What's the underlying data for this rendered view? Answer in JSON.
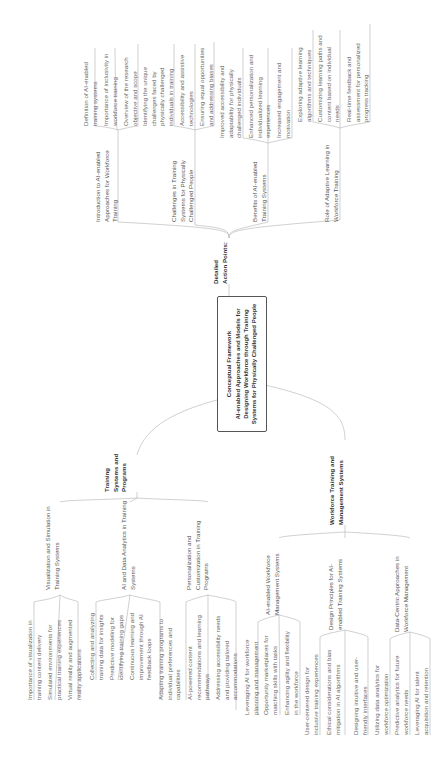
{
  "diagram": {
    "type": "mind-map",
    "orientation": "rotated-90",
    "root": {
      "title": "Conceptual Framework",
      "subtitle": "AI-enabled Approaches and Models for Designing Workforce through Training Systems for Physically Challenged People"
    },
    "branches": [
      {
        "label": "Detailed Action Points:",
        "children": [
          {
            "label": "Introduction to AI-enabled Approaches for Workforce Training",
            "leaves": [
              "Definition of AI-enabled training systems",
              "Importance of inclusivity in workforce training",
              "Overview of the research objective and scope"
            ]
          },
          {
            "label": "Challenges in Training Systems for Physically Challenged People",
            "leaves": [
              "Identifying the unique challenges faced by physically challenged individuals in training",
              "Accessibility and assistive technologies",
              "Ensuring equal opportunities and addressing biases"
            ]
          },
          {
            "label": "Benefits of AI-enabled Training Systems",
            "leaves": [
              "Improved accessibility and adaptability for physically challenged individuals",
              "Enhanced personalization and individualized learning experiences",
              "Increased engagement and motivation"
            ]
          },
          {
            "label": "Role of Adaptive Learning in Workforce Training",
            "leaves": [
              "Exploring adaptive learning algorithms and techniques",
              "Customizing learning paths and content based on individual needs",
              "Real-time feedback and assessment for personalized progress tracking"
            ]
          }
        ]
      },
      {
        "label": "Training Systems and Programs",
        "children": [
          {
            "label": "Visualization and Simulation in Training Systems",
            "leaves": [
              "Importance of visualization in training content delivery",
              "Simulated environments for practical training experiences",
              "Virtual reality and augmented reality applications"
            ]
          },
          {
            "label": "AI and Data Analytics in Training Systems",
            "leaves": [
              "Collecting and analyzing training data for insights",
              "Predictive modeling for identifying training gaps",
              "Continuous learning and improvement through AI feedback loops"
            ]
          },
          {
            "label": "Personalization and Customization in Training Programs",
            "leaves": [
              "Adapting training programs to individual preferences and capabilities",
              "AI-powered content recommendations and learning pathways",
              "Addressing accessibility needs and providing tailored accommodations"
            ]
          }
        ]
      },
      {
        "label": "Workforce Training and Management Systems",
        "children": [
          {
            "label": "AI-enabled Workforce Management Systems",
            "leaves": [
              "Leveraging AI for workforce planning and management",
              "Opportunity marketplaces for matching skills with tasks",
              "Enhancing agility and flexibility in the workforce"
            ]
          },
          {
            "label": "Design Principles for AI-enabled Training Systems",
            "leaves": [
              "User-centered design for inclusive training experiences",
              "Ethical considerations and bias mitigation in AI algorithms",
              "Designing intuitive and user-friendly interfaces"
            ]
          },
          {
            "label": "Data-Centric Approaches in Workforce Management",
            "leaves": [
              "Utilizing data analytics for workforce optimization",
              "Predictive analytics for future workforce needs",
              "Leveraging AI for talent acquisition and retention"
            ]
          }
        ]
      }
    ]
  }
}
